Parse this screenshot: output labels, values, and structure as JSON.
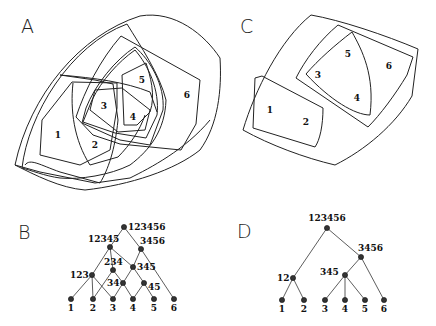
{
  "panels": {
    "A": {
      "letter": "A",
      "regions": [
        {
          "label": "1",
          "x": 58,
          "y": 138
        },
        {
          "label": "2",
          "x": 95,
          "y": 148
        },
        {
          "label": "3",
          "x": 104,
          "y": 109
        },
        {
          "label": "4",
          "x": 133,
          "y": 120
        },
        {
          "label": "5",
          "x": 142,
          "y": 83
        },
        {
          "label": "6",
          "x": 187,
          "y": 98
        }
      ]
    },
    "B": {
      "letter": "B",
      "nodes": [
        {
          "id": "123456",
          "label": "123456",
          "x": 124,
          "y": 227
        },
        {
          "id": "12345",
          "label": "12345",
          "x": 110,
          "y": 247
        },
        {
          "id": "3456",
          "label": "3456",
          "x": 141,
          "y": 249
        },
        {
          "id": "234",
          "label": "234",
          "x": 113,
          "y": 270
        },
        {
          "id": "345",
          "label": "345",
          "x": 133,
          "y": 267
        },
        {
          "id": "123",
          "label": "123",
          "x": 92,
          "y": 275
        },
        {
          "id": "34",
          "label": "34",
          "x": 123,
          "y": 283
        },
        {
          "id": "45",
          "label": "45",
          "x": 144,
          "y": 283
        },
        {
          "id": "1",
          "label": "1",
          "x": 71,
          "y": 299
        },
        {
          "id": "2",
          "label": "2",
          "x": 93,
          "y": 299
        },
        {
          "id": "3",
          "label": "3",
          "x": 113,
          "y": 299
        },
        {
          "id": "4",
          "label": "4",
          "x": 133,
          "y": 299
        },
        {
          "id": "5",
          "label": "5",
          "x": 154,
          "y": 299
        },
        {
          "id": "6",
          "label": "6",
          "x": 174,
          "y": 299
        }
      ],
      "edges": [
        [
          "123456",
          "12345"
        ],
        [
          "123456",
          "3456"
        ],
        [
          "12345",
          "123"
        ],
        [
          "12345",
          "234"
        ],
        [
          "12345",
          "345"
        ],
        [
          "3456",
          "345"
        ],
        [
          "3456",
          "6"
        ],
        [
          "123",
          "1"
        ],
        [
          "123",
          "2"
        ],
        [
          "123",
          "3"
        ],
        [
          "234",
          "2"
        ],
        [
          "234",
          "34"
        ],
        [
          "345",
          "34"
        ],
        [
          "345",
          "45"
        ],
        [
          "34",
          "3"
        ],
        [
          "34",
          "4"
        ],
        [
          "45",
          "4"
        ],
        [
          "45",
          "5"
        ]
      ]
    },
    "C": {
      "letter": "C",
      "regions": [
        {
          "label": "1",
          "x": 270,
          "y": 113
        },
        {
          "label": "2",
          "x": 306,
          "y": 125
        },
        {
          "label": "3",
          "x": 318,
          "y": 78
        },
        {
          "label": "4",
          "x": 357,
          "y": 101
        },
        {
          "label": "5",
          "x": 348,
          "y": 57
        },
        {
          "label": "6",
          "x": 389,
          "y": 69
        }
      ]
    },
    "D": {
      "letter": "D",
      "nodes": [
        {
          "id": "123456",
          "label": "123456",
          "x": 327,
          "y": 228
        },
        {
          "id": "3456",
          "label": "3456",
          "x": 361,
          "y": 257
        },
        {
          "id": "12",
          "label": "12",
          "x": 293,
          "y": 278
        },
        {
          "id": "345",
          "label": "345",
          "x": 345,
          "y": 275
        },
        {
          "id": "1",
          "label": "1",
          "x": 282,
          "y": 300
        },
        {
          "id": "2",
          "label": "2",
          "x": 304,
          "y": 300
        },
        {
          "id": "3",
          "label": "3",
          "x": 325,
          "y": 300
        },
        {
          "id": "4",
          "label": "4",
          "x": 345,
          "y": 300
        },
        {
          "id": "5",
          "label": "5",
          "x": 365,
          "y": 300
        },
        {
          "id": "6",
          "label": "6",
          "x": 384,
          "y": 300
        }
      ],
      "edges": [
        [
          "123456",
          "12"
        ],
        [
          "123456",
          "3456"
        ],
        [
          "3456",
          "345"
        ],
        [
          "3456",
          "6"
        ],
        [
          "12",
          "1"
        ],
        [
          "12",
          "2"
        ],
        [
          "345",
          "3"
        ],
        [
          "345",
          "4"
        ],
        [
          "345",
          "5"
        ]
      ]
    }
  }
}
